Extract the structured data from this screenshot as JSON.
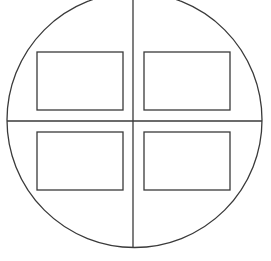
{
  "diagram": {
    "background": "#ffffff",
    "stroke": "#3a3a3a",
    "stroke_width": 1.3,
    "circle": {
      "cx": 134.5,
      "cy": 120,
      "r": 127.5
    },
    "vertical_divider": {
      "x": 133,
      "y1": 0,
      "y2": 247
    },
    "horizontal_divider": {
      "y": 121,
      "x1": 7,
      "x2": 262
    },
    "quadrant_boxes": [
      {
        "id": "top-left",
        "x": 37,
        "y": 52,
        "w": 86,
        "h": 58
      },
      {
        "id": "top-right",
        "x": 144,
        "y": 52,
        "w": 86,
        "h": 58
      },
      {
        "id": "bottom-left",
        "x": 37,
        "y": 132,
        "w": 86,
        "h": 58
      },
      {
        "id": "bottom-right",
        "x": 144,
        "y": 132,
        "w": 86,
        "h": 58
      }
    ]
  }
}
